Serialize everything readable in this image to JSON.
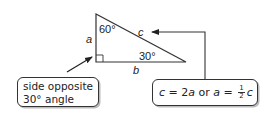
{
  "triangle": {
    "angle_top": "60°",
    "angle_right": "30°",
    "side_a": "a",
    "side_b": "b",
    "side_c": "c"
  },
  "callout_left": {
    "line1": "side opposite",
    "line2": "30° angle"
  },
  "callout_right": {
    "eq1_lhs": "c",
    "eq1_eq": " = 2",
    "eq1_rhs": "a",
    "or": " or ",
    "eq2_lhs": "a",
    "eq2_eq": " = ",
    "frac_num": "1",
    "frac_den": "2",
    "eq2_rhs": "c"
  },
  "colors": {
    "stroke": "#333333",
    "text": "#222222"
  }
}
